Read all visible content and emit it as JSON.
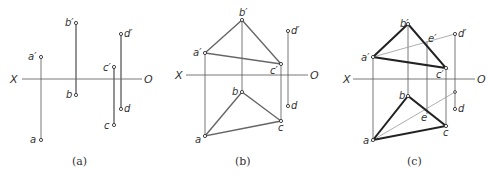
{
  "panels": [
    {
      "id": "a",
      "caption": "(a)",
      "axis": {
        "x_label": "X",
        "o_label": "O"
      },
      "points": {
        "a_prime": "a′",
        "a": "a",
        "b_prime": "b′",
        "b": "b",
        "c_prime": "c′",
        "c": "c",
        "d_prime": "d′",
        "d": "d"
      }
    },
    {
      "id": "b",
      "caption": "(b)",
      "axis": {
        "x_label": "X",
        "o_label": "O"
      },
      "points": {
        "a_prime": "a′",
        "a": "a",
        "b_prime": "b′",
        "b": "b",
        "c_prime": "c′",
        "c": "c",
        "d_prime": "d′",
        "d": "d"
      }
    },
    {
      "id": "c",
      "caption": "(c)",
      "axis": {
        "x_label": "X",
        "o_label": "O"
      },
      "points": {
        "a_prime": "a′",
        "a": "a",
        "b_prime": "b′",
        "b": "b",
        "c_prime": "c′",
        "c": "c",
        "d_prime": "d′",
        "d": "d",
        "e_prime": "e′",
        "e": "e"
      }
    }
  ]
}
